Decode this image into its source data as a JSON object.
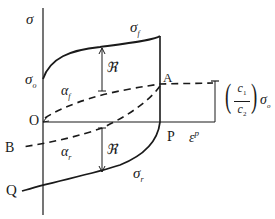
{
  "diagram": {
    "type": "stress-strain hysteresis (kinematic/isotropic hardening)",
    "axes": {
      "y_label": "σ",
      "x_label": "ε",
      "x_label_sup": "p",
      "origin_label": "O"
    },
    "points": {
      "A": "A",
      "B": "B",
      "P": "P",
      "Q": "Q"
    },
    "curves": {
      "forward_yield": "σ",
      "forward_yield_sub": "f",
      "reverse_yield": "σ",
      "reverse_yield_sub": "r",
      "back_stress_forward": "α",
      "back_stress_forward_sub": "f",
      "back_stress_reverse": "α",
      "back_stress_reverse_sub": "r"
    },
    "annotations": {
      "initial_yield": "σ",
      "initial_yield_sub": "o",
      "radius_upper": "ℜ",
      "radius_lower": "ℜ",
      "saturation_label_num": "c",
      "saturation_label_num_sub": "1",
      "saturation_label_den": "c",
      "saturation_label_den_sub": "2",
      "saturation_label_sigma": "σ",
      "saturation_label_sigma_sub": "o",
      "paren_open": "(",
      "paren_close": ")"
    },
    "colors": {
      "line": "#1a1a1a",
      "background": "#ffffff"
    }
  }
}
